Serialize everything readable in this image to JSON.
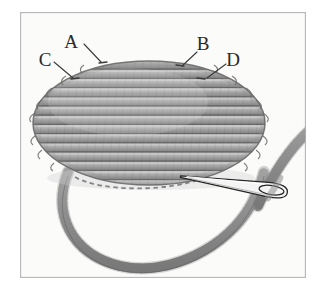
{
  "figure": {
    "caption": "",
    "frame": {
      "x": 20,
      "y": 12,
      "width": 286,
      "height": 266,
      "border_color": "#b9b9b9",
      "fill_color": "#fdfdfd"
    },
    "palette": {
      "paper": "#fbfbfa",
      "page_background": "#ffffff",
      "thread_light": "#c2c2c2",
      "thread_mid": "#a6a6a6",
      "thread_dark": "#8a8a8a",
      "outline": "#6f6f6f",
      "ink": "#2a2a2a",
      "needle_metal": "#f4f4f4",
      "needle_outline": "#262626",
      "hidden_thread": "#5c5c5c"
    },
    "labels": [
      {
        "id": "A",
        "text": "A",
        "x": 71,
        "y": 48,
        "leader": "M 84 44 L 101 62"
      },
      {
        "id": "B",
        "text": "B",
        "x": 198,
        "y": 50,
        "leader": "M 197 52 L 182 66"
      },
      {
        "id": "C",
        "text": "C",
        "x": 40,
        "y": 66,
        "leader": "M 54 62 L 73 78"
      },
      {
        "id": "D",
        "text": "D",
        "x": 227,
        "y": 66,
        "leader": "M 226 64 L 207 78"
      }
    ],
    "mound": {
      "description": "Oval of stacked horizontal satin stitch thread rows",
      "center_x": 149,
      "center_y": 123,
      "radius_x": 116,
      "radius_y": 62,
      "row_count": 14,
      "row_height": 9.2
    },
    "hidden_stitch": {
      "description": "Dashed line indicating thread hidden beneath the fabric",
      "path": "M 75 177 C 100 192, 170 192, 203 178"
    },
    "needle": {
      "description": "Threaded sewing needle pointing left",
      "tip_x": 180,
      "tip_y": 176,
      "eye_x": 284,
      "eye_y": 192,
      "length": 106
    },
    "thread_loop": {
      "description": "Slack loop of working thread hanging below the stitched shape",
      "entry_x": 68,
      "exit_x": 258
    }
  },
  "annotations": {
    "letter_a": "A",
    "letter_b": "B",
    "letter_c": "C",
    "letter_d": "D"
  }
}
